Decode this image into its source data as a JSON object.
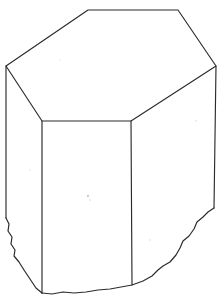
{
  "figure": {
    "caption": "",
    "background_color": "#ffffff",
    "line_color": "#2b2b2b",
    "line_width_px": 1.15,
    "canvas": {
      "width": 224,
      "height": 303
    }
  },
  "geometry": {
    "top_face": {
      "name": "hexagonal-top-face",
      "sides": 6,
      "vertices": [
        [
          6,
          66
        ],
        [
          88,
          10
        ],
        [
          178,
          10
        ],
        [
          216,
          66
        ],
        [
          131,
          121
        ],
        [
          42,
          121
        ]
      ]
    },
    "left_face": {
      "name": "left-side-face",
      "vertices": [
        [
          6,
          66
        ],
        [
          42,
          121
        ],
        [
          42,
          293
        ],
        [
          6,
          218
        ]
      ]
    },
    "front_face": {
      "name": "front-side-face",
      "vertices": [
        [
          42,
          121
        ],
        [
          131,
          121
        ],
        [
          132,
          285
        ],
        [
          42,
          293
        ]
      ]
    },
    "right_face": {
      "name": "right-side-face",
      "vertices": [
        [
          131,
          121
        ],
        [
          216,
          66
        ],
        [
          214,
          208
        ],
        [
          132,
          285
        ]
      ]
    },
    "vertical_edges": [
      {
        "name": "left-outer-edge",
        "from": [
          6,
          66
        ],
        "to": [
          6,
          218
        ]
      },
      {
        "name": "left-front-edge",
        "from": [
          42,
          121
        ],
        "to": [
          42,
          293
        ]
      },
      {
        "name": "right-front-edge",
        "from": [
          131,
          121
        ],
        "to": [
          132,
          285
        ]
      },
      {
        "name": "right-outer-edge",
        "from": [
          216,
          66
        ],
        "to": [
          214,
          208
        ]
      }
    ],
    "fracture_paths": {
      "left_fracture": {
        "name": "left-broken-edge",
        "points": [
          [
            6,
            218
          ],
          [
            9,
            224
          ],
          [
            8,
            231
          ],
          [
            12,
            237
          ],
          [
            11,
            244
          ],
          [
            15,
            250
          ],
          [
            14,
            256
          ],
          [
            19,
            262
          ],
          [
            24,
            270
          ],
          [
            30,
            279
          ],
          [
            36,
            288
          ],
          [
            42,
            293
          ]
        ]
      },
      "bottom_fracture": {
        "name": "bottom-broken-edge",
        "points": [
          [
            42,
            293
          ],
          [
            52,
            294
          ],
          [
            63,
            292
          ],
          [
            74,
            293
          ],
          [
            86,
            292
          ],
          [
            98,
            290
          ],
          [
            110,
            289
          ],
          [
            121,
            287
          ],
          [
            132,
            285
          ],
          [
            143,
            281
          ],
          [
            152,
            276
          ],
          [
            158,
            270
          ],
          [
            163,
            266
          ],
          [
            170,
            262
          ],
          [
            176,
            255
          ],
          [
            180,
            248
          ],
          [
            183,
            241
          ],
          [
            189,
            236
          ],
          [
            194,
            229
          ],
          [
            197,
            222
          ],
          [
            203,
            217
          ],
          [
            208,
            212
          ],
          [
            214,
            208
          ]
        ]
      }
    }
  },
  "labels": {
    "top_face_label": "",
    "front_face_label": "",
    "left_face_label": "",
    "right_face_label": ""
  },
  "specks": [
    {
      "x": 88,
      "y": 196,
      "r": 1.2
    },
    {
      "x": 90,
      "y": 200,
      "r": 0.8
    },
    {
      "x": 196,
      "y": 121,
      "r": 0.7
    },
    {
      "x": 60,
      "y": 60,
      "r": 0.6
    },
    {
      "x": 150,
      "y": 240,
      "r": 0.7
    },
    {
      "x": 30,
      "y": 170,
      "r": 0.6
    }
  ]
}
